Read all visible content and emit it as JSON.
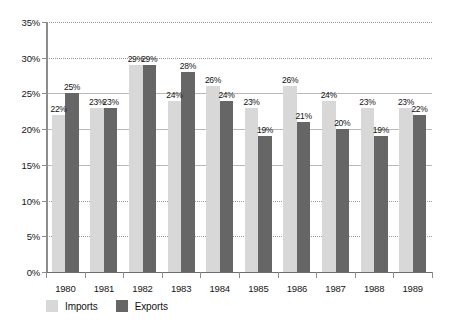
{
  "chart_data": {
    "type": "bar",
    "title": "",
    "xlabel": "",
    "ylabel": "",
    "ylim": [
      0,
      35
    ],
    "ytick_labels": [
      "0%",
      "5%",
      "10%",
      "15%",
      "20%",
      "25%",
      "30%",
      "35%"
    ],
    "ytick_values": [
      0,
      5,
      10,
      15,
      20,
      25,
      30,
      35
    ],
    "grid": true,
    "legend_position": "bottom-left",
    "categories": [
      "1980",
      "1981",
      "1982",
      "1983",
      "1984",
      "1985",
      "1986",
      "1987",
      "1988",
      "1989"
    ],
    "series": [
      {
        "name": "Imports",
        "color": "#d8d8d8",
        "values": [
          22,
          23,
          29,
          24,
          26,
          23,
          26,
          24,
          23,
          23
        ],
        "value_labels": [
          "22%",
          "23%",
          "29%",
          "24%",
          "26%",
          "23%",
          "26%",
          "24%",
          "23%",
          "23%"
        ]
      },
      {
        "name": "Exports",
        "color": "#666666",
        "values": [
          25,
          23,
          29,
          28,
          24,
          19,
          21,
          20,
          19,
          22
        ],
        "value_labels": [
          "25%",
          "23%",
          "29%",
          "28%",
          "24%",
          "19%",
          "21%",
          "20%",
          "19%",
          "22%"
        ]
      }
    ]
  },
  "legend": {
    "items": [
      {
        "label": "Imports",
        "key": "imports"
      },
      {
        "label": "Exports",
        "key": "exports"
      }
    ]
  },
  "colors": {
    "imports": "#d8d8d8",
    "exports": "#666666",
    "axis": "#8d8d8d",
    "grid": "#9a9a9a",
    "text": "#161616",
    "background": "#ffffff"
  }
}
